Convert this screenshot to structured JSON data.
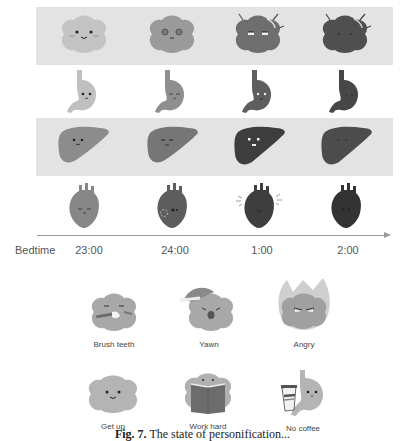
{
  "figure": {
    "rows": [
      {
        "organ": "brain",
        "background": "gray",
        "colors": [
          "#c4c4c4",
          "#9a9a9a",
          "#6e6e6e",
          "#4f4f4f"
        ],
        "expressions": [
          "smile",
          "dizzy",
          "tired",
          "asleep"
        ]
      },
      {
        "organ": "stomach",
        "background": "white",
        "colors": [
          "#c0c0c0",
          "#8f8f8f",
          "#5e5e5e",
          "#474747"
        ],
        "expressions": [
          "smile",
          "sad",
          "tired",
          "asleep"
        ]
      },
      {
        "organ": "liver",
        "background": "gray",
        "colors": [
          "#8c8c8c",
          "#767676",
          "#3e3e3e",
          "#4c4c4c"
        ],
        "expressions": [
          "smile",
          "neutral",
          "shocked",
          "asleep"
        ]
      },
      {
        "organ": "heart",
        "background": "white",
        "colors": [
          "#878787",
          "#5d5d5d",
          "#3e3e3e",
          "#333333"
        ],
        "expressions": [
          "smile",
          "hurt",
          "racing",
          "asleep"
        ]
      }
    ],
    "axis": {
      "label": "Bedtime",
      "ticks": [
        "23:00",
        "24:00",
        "1:00",
        "2:00"
      ]
    },
    "moods": [
      {
        "label": "Brush teeth",
        "icon": "brain-brushing-icon"
      },
      {
        "label": "Yawn",
        "icon": "brain-yawn-icon"
      },
      {
        "label": "Angry",
        "icon": "brain-angry-icon"
      },
      {
        "label": "Get up",
        "icon": "brain-getup-icon"
      },
      {
        "label": "Work hard",
        "icon": "brain-book-icon"
      },
      {
        "label": "No coffee",
        "icon": "stomach-coffee-icon"
      }
    ],
    "caption": {
      "prefix": "Fig. 7.",
      "text": "The state of personification..."
    }
  }
}
